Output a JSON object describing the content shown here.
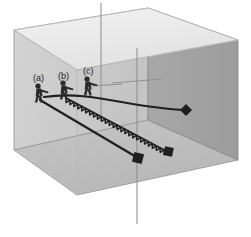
{
  "figure": {
    "title": "",
    "type": "3d-box-trajectory-diagram",
    "background_color": "#ffffff"
  },
  "box": {
    "name": "rectangular-enclosure",
    "faces": {
      "top_color": "#e9e9e9",
      "back_left_color": "#cccccc",
      "front_right_color": "#a3a3a3",
      "bottom_color": "#bdbdbd",
      "edge_color": "#8f8f8f"
    },
    "vertices": {
      "back_top_left": [
        14,
        30
      ],
      "back_top_right": [
        148,
        8
      ],
      "front_top_right": [
        238,
        40
      ],
      "front_top_left": [
        77,
        70
      ],
      "back_bottom_left": [
        14,
        150
      ],
      "front_bottom_left": [
        77,
        195
      ],
      "front_bottom_right": [
        238,
        160
      ],
      "back_bottom_right": [
        148,
        120
      ]
    }
  },
  "axis_rods": [
    {
      "name": "rod-rear",
      "x1": 101,
      "y1": 3,
      "x2": 101,
      "y2": 120
    },
    {
      "name": "rod-front",
      "x1": 137,
      "y1": 50,
      "x2": 137,
      "y2": 222
    },
    {
      "name": "rod-cross",
      "x1": 110,
      "y1": 82,
      "x2": 160,
      "y2": 80
    }
  ],
  "shooters": [
    {
      "id": "a",
      "label": "(a)",
      "label_pos": [
        33,
        73
      ],
      "figure_pos": [
        37,
        95
      ],
      "trajectory": {
        "type": "curved",
        "description": "smoothly curving arc",
        "start": [
          42,
          97
        ],
        "control1": [
          110,
          92
        ],
        "control2": [
          140,
          112
        ],
        "end": [
          186,
          110
        ],
        "marker": "diamond"
      }
    },
    {
      "id": "b",
      "label": "(b)",
      "label_pos": [
        58,
        71
      ],
      "figure_pos": [
        62,
        92
      ],
      "trajectory": {
        "type": "straight",
        "description": "straight descending line",
        "start": [
          38,
          100
        ],
        "end": [
          140,
          160
        ],
        "marker": "square"
      }
    },
    {
      "id": "c",
      "label": "(c)",
      "label_pos": [
        83,
        66
      ],
      "figure_pos": [
        86,
        88
      ],
      "trajectory": {
        "type": "sawtooth",
        "description": "oscillating zigzag / helical spiral path",
        "start": [
          66,
          98
        ],
        "end": [
          168,
          152
        ],
        "marker": "square",
        "teeth": 26,
        "amplitude": 4
      }
    }
  ],
  "stroke": {
    "trajectory_color": "#1f1f1f",
    "trajectory_width": 2.0,
    "figure_color": "#2b2b2b"
  }
}
